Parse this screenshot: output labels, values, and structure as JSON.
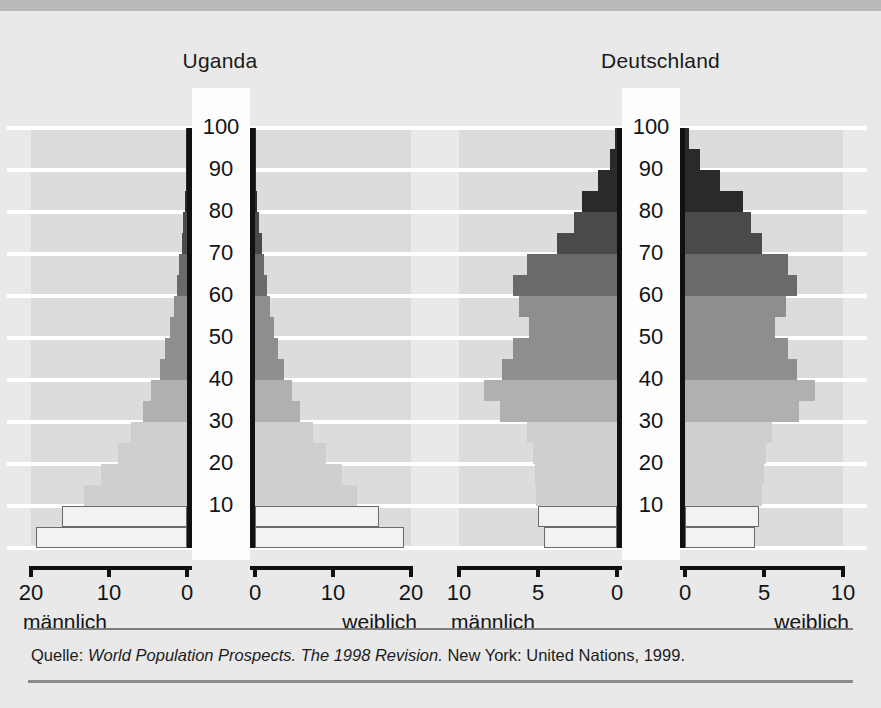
{
  "source": {
    "prefix": "Quelle:",
    "italic": "World Population Prospects. The 1998 Revision.",
    "suffix": "New York: United Nations, 1999."
  },
  "panels": {
    "uganda": {
      "title": "Uganda",
      "male_label": "männlich",
      "female_label": "weiblich",
      "ticks_male": [
        "20",
        "10",
        "0"
      ],
      "ticks_female": [
        "0",
        "10",
        "20"
      ]
    },
    "germany": {
      "title": "Deutschland",
      "male_label": "männlich",
      "female_label": "weiblich",
      "ticks_male": [
        "10",
        "5",
        "0"
      ],
      "ticks_female": [
        "0",
        "5",
        "10"
      ]
    }
  },
  "age_axis_labels": [
    "100",
    "90",
    "80",
    "70",
    "60",
    "50",
    "40",
    "30",
    "20",
    "10"
  ],
  "palette": {
    "background": "#e9e9e9",
    "top_strip": "#b9b9b9",
    "plot_field": "#dcdcdc",
    "gridline": "#ffffff",
    "center_column": "#fdfdfd",
    "axis_black": "#111111",
    "band_youngest": "#f2f2f2",
    "band_light": "#cfcfcf",
    "band_mid_light": "#b0b0b0",
    "band_mid": "#8e8e8e",
    "band_dark": "#6a6a6a",
    "band_darker": "#4a4a4a",
    "band_darkest": "#2a2a2a"
  },
  "chart_data": {
    "type": "bar",
    "subtype": "population-pyramid",
    "xlabel": "Anteil an der Bevölkerung in Prozent",
    "ylabel": "Alter in Jahren",
    "age_groups": [
      "0-4",
      "5-9",
      "10-14",
      "15-19",
      "20-24",
      "25-29",
      "30-34",
      "35-39",
      "40-44",
      "45-49",
      "50-54",
      "55-59",
      "60-64",
      "65-69",
      "70-74",
      "75-79",
      "80-84",
      "85-89",
      "90-94",
      "95-99"
    ],
    "grid": true,
    "legend_position": "below-axis",
    "charts": [
      {
        "name": "Uganda",
        "xlim": [
          0,
          20
        ],
        "xticks": [
          0,
          10,
          20
        ],
        "ylim": [
          0,
          100
        ],
        "yticks": [
          10,
          20,
          30,
          40,
          50,
          60,
          70,
          80,
          90,
          100
        ],
        "series": [
          {
            "name": "männlich",
            "side": "left",
            "values": [
              19.3,
              16.0,
              13.2,
              11.0,
              8.9,
              7.2,
              5.6,
              4.6,
              3.5,
              2.8,
              2.2,
              1.7,
              1.3,
              1.0,
              0.7,
              0.45,
              0.25,
              0.12,
              0.05,
              0.02
            ]
          },
          {
            "name": "weiblich",
            "side": "right",
            "values": [
              19.1,
              15.9,
              13.1,
              11.1,
              9.1,
              7.4,
              5.8,
              4.8,
              3.7,
              3.0,
              2.4,
              1.9,
              1.5,
              1.2,
              0.85,
              0.55,
              0.3,
              0.15,
              0.06,
              0.02
            ]
          }
        ]
      },
      {
        "name": "Deutschland",
        "xlim": [
          0,
          10
        ],
        "xticks": [
          0,
          5,
          10
        ],
        "ylim": [
          0,
          100
        ],
        "yticks": [
          10,
          20,
          30,
          40,
          50,
          60,
          70,
          80,
          90,
          100
        ],
        "series": [
          {
            "name": "männlich",
            "side": "left",
            "values": [
              4.6,
              5.0,
              5.1,
              5.2,
              5.3,
              5.7,
              7.4,
              8.4,
              7.3,
              6.6,
              5.6,
              6.2,
              6.6,
              5.7,
              3.8,
              2.7,
              2.2,
              1.2,
              0.45,
              0.12
            ]
          },
          {
            "name": "weiblich",
            "side": "right",
            "values": [
              4.4,
              4.7,
              4.9,
              5.0,
              5.1,
              5.5,
              7.2,
              8.2,
              7.1,
              6.5,
              5.7,
              6.4,
              7.1,
              6.5,
              4.9,
              4.2,
              3.7,
              2.2,
              0.95,
              0.25
            ]
          }
        ]
      }
    ]
  }
}
